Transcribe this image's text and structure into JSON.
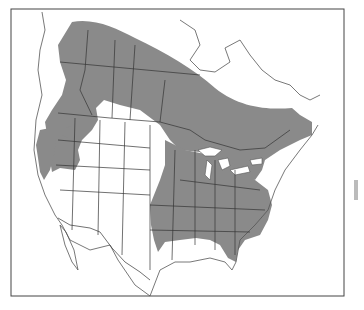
{
  "map": {
    "title": "",
    "region": "North America",
    "type": "species range map",
    "colors": {
      "range": "#8a8a8a",
      "background": "#ffffff",
      "lines": "#444444"
    }
  }
}
